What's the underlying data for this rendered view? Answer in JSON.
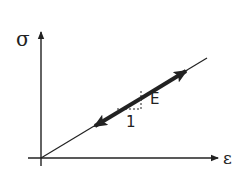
{
  "diagram": {
    "y_axis_label": "σ",
    "x_axis_label": "ε",
    "slope_label": "E",
    "run_label": "1",
    "colors": {
      "line": "#222222",
      "background": "#ffffff"
    }
  }
}
